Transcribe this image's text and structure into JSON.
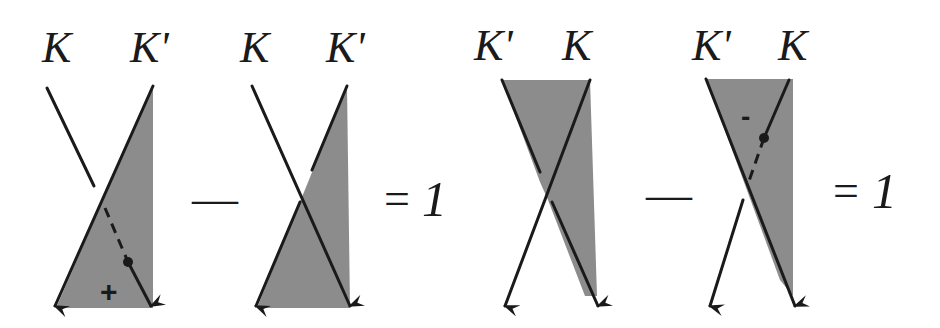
{
  "figure": {
    "colors": {
      "shade": "#8c8c8c",
      "ink": "#1a1a1a",
      "background": "#ffffff"
    },
    "equations": [
      {
        "terms": [
          {
            "labels": {
              "left": "K",
              "right": "K'"
            },
            "sign_mark": "+",
            "features": [
              "shaded triangle",
              "broken strand K",
              "dashed path with dot"
            ]
          },
          {
            "labels": {
              "left": "K",
              "right": "K'"
            },
            "features": [
              "shaded triangle",
              "crossing strands"
            ]
          }
        ],
        "operator": "—",
        "equals": "=",
        "result": "1"
      },
      {
        "terms": [
          {
            "labels": {
              "left": "K'",
              "right": "K"
            },
            "features": [
              "shaded region",
              "crossing strands"
            ]
          },
          {
            "labels": {
              "left": "K'",
              "right": "K"
            },
            "sign_mark": "-",
            "features": [
              "shaded region",
              "dashed path with dot",
              "broken strand K"
            ]
          }
        ],
        "operator": "—",
        "equals": "=",
        "result": "1"
      }
    ]
  }
}
